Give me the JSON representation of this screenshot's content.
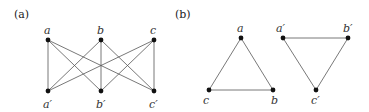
{
  "panels": [
    {
      "label": "(a)",
      "nodes": {
        "a": {
          "label": "a"
        },
        "b": {
          "label": "b"
        },
        "c": {
          "label": "c"
        },
        "a_prime": {
          "label": "a′"
        },
        "b_prime": {
          "label": "b′"
        },
        "c_prime": {
          "label": "c′"
        }
      },
      "edges": [
        [
          "a",
          "a′"
        ],
        [
          "a",
          "b′"
        ],
        [
          "a",
          "c′"
        ],
        [
          "b",
          "a′"
        ],
        [
          "b",
          "b′"
        ],
        [
          "b",
          "c′"
        ],
        [
          "c",
          "a′"
        ],
        [
          "c",
          "b′"
        ],
        [
          "c",
          "c′"
        ]
      ]
    },
    {
      "label": "(b)",
      "nodes": {
        "a": {
          "label": "a"
        },
        "b": {
          "label": "b"
        },
        "c": {
          "label": "c"
        },
        "a_prime": {
          "label": "a′"
        },
        "b_prime": {
          "label": "b′"
        },
        "c_prime": {
          "label": "c′"
        }
      },
      "edges": [
        [
          "a",
          "b"
        ],
        [
          "b",
          "c"
        ],
        [
          "c",
          "a"
        ],
        [
          "a′",
          "b′"
        ],
        [
          "b′",
          "c′"
        ],
        [
          "c′",
          "a′"
        ]
      ]
    }
  ]
}
